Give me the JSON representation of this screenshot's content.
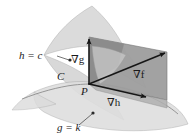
{
  "figure": {
    "width": 195,
    "height": 137,
    "background": "#ffffff"
  },
  "labels": {
    "surface_h": "h = c",
    "surface_g": "g = k",
    "curve": "C",
    "point": "P",
    "grad_g": "∇g",
    "grad_f": "∇f",
    "grad_h": "∇h"
  },
  "colors": {
    "ink": "#1a1a1a",
    "surface_light": "#d9d9d9",
    "surface_mid": "#c4c4c4",
    "surface_dark": "#9a9a9a",
    "surface_darkest": "#8a8a8a",
    "outline": "#8f8f8f",
    "leader": "#444444"
  },
  "geometry": {
    "origin_point": [
      89,
      84
    ],
    "grad_g_tip": [
      89,
      37
    ],
    "grad_f_tip": [
      167,
      52
    ],
    "grad_h_tip": [
      149,
      98
    ]
  },
  "leader_lines": [
    {
      "name": "leader-h-c",
      "from": [
        70,
        60
      ],
      "to": [
        56,
        56
      ],
      "dot": [
        70,
        60
      ]
    },
    {
      "name": "leader-g-k",
      "from": [
        93,
        113
      ],
      "to": [
        78,
        126
      ],
      "dot": [
        93,
        113
      ]
    }
  ]
}
